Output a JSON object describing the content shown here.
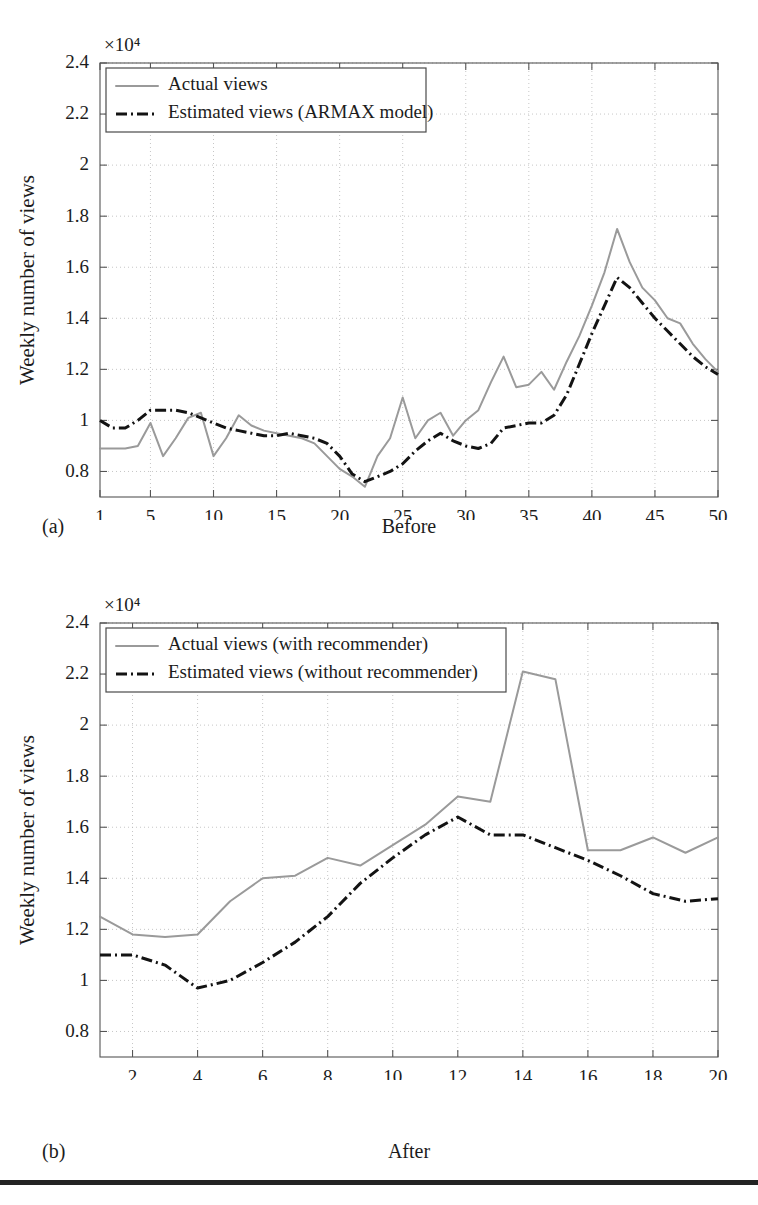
{
  "figure": {
    "panel_a": {
      "tag": "(a)",
      "caption": "Before"
    },
    "panel_b": {
      "tag": "(b)",
      "caption": "After"
    },
    "bottom_rule_color": "#232323"
  },
  "colors": {
    "actual_series": "#9a9a9a",
    "estimated_series": "#131313",
    "axis": "#555555",
    "grid": "#b8b8b8",
    "text": "#1c1c1c"
  },
  "chart_data": [
    {
      "id": "chart-before",
      "type": "line",
      "title": "",
      "xlabel": "Week",
      "ylabel": "Weekly number of views",
      "exponent_label": "×10⁴",
      "y_scale_factor": 10000,
      "xlim": [
        1,
        50
      ],
      "ylim": [
        0.7,
        2.4
      ],
      "yticks": [
        0.8,
        1,
        1.2,
        1.4,
        1.6,
        1.8,
        2,
        2.2,
        2.4
      ],
      "ytick_labels": [
        "0.8",
        "1",
        "1.2",
        "1.4",
        "1.6",
        "1.8",
        "2",
        "2.2",
        "2.4"
      ],
      "xticks": [
        1,
        5,
        10,
        15,
        20,
        25,
        30,
        35,
        40,
        45,
        50
      ],
      "xtick_labels": [
        "1",
        "5",
        "10",
        "15",
        "20",
        "25",
        "30",
        "35",
        "40",
        "45",
        "50"
      ],
      "grid": true,
      "legend_position": "top-left",
      "x": [
        1,
        2,
        3,
        4,
        5,
        6,
        7,
        8,
        9,
        10,
        11,
        12,
        13,
        14,
        15,
        16,
        17,
        18,
        19,
        20,
        21,
        22,
        23,
        24,
        25,
        26,
        27,
        28,
        29,
        30,
        31,
        32,
        33,
        34,
        35,
        36,
        37,
        38,
        39,
        40,
        41,
        42,
        43,
        44,
        45,
        46,
        47,
        48,
        49,
        50
      ],
      "series": [
        {
          "name": "Actual views",
          "style": "solid",
          "color": "#9a9a9a",
          "values": [
            0.89,
            0.89,
            0.89,
            0.9,
            0.99,
            0.86,
            0.93,
            1.01,
            1.03,
            0.86,
            0.93,
            1.02,
            0.98,
            0.96,
            0.95,
            0.94,
            0.93,
            0.91,
            0.86,
            0.81,
            0.78,
            0.74,
            0.86,
            0.93,
            1.09,
            0.93,
            1.0,
            1.03,
            0.94,
            1.0,
            1.04,
            1.15,
            1.25,
            1.13,
            1.14,
            1.19,
            1.12,
            1.23,
            1.33,
            1.45,
            1.58,
            1.75,
            1.62,
            1.52,
            1.47,
            1.4,
            1.38,
            1.3,
            1.24,
            1.19
          ]
        },
        {
          "name": "Estimated views (ARMAX model)",
          "style": "dashdot",
          "color": "#131313",
          "values": [
            1.0,
            0.97,
            0.97,
            1.0,
            1.04,
            1.04,
            1.04,
            1.03,
            1.01,
            0.99,
            0.97,
            0.96,
            0.95,
            0.94,
            0.94,
            0.95,
            0.94,
            0.93,
            0.91,
            0.86,
            0.79,
            0.76,
            0.78,
            0.8,
            0.83,
            0.88,
            0.92,
            0.95,
            0.92,
            0.9,
            0.89,
            0.91,
            0.97,
            0.98,
            0.99,
            0.99,
            1.02,
            1.1,
            1.22,
            1.34,
            1.45,
            1.56,
            1.52,
            1.46,
            1.4,
            1.35,
            1.3,
            1.25,
            1.21,
            1.18
          ]
        }
      ]
    },
    {
      "id": "chart-after",
      "type": "line",
      "title": "",
      "xlabel": "Week",
      "ylabel": "Weekly number of views",
      "exponent_label": "×10⁴",
      "y_scale_factor": 10000,
      "xlim": [
        1,
        20
      ],
      "ylim": [
        0.7,
        2.4
      ],
      "yticks": [
        0.8,
        1,
        1.2,
        1.4,
        1.6,
        1.8,
        2,
        2.2,
        2.4
      ],
      "ytick_labels": [
        "0.8",
        "1",
        "1.2",
        "1.4",
        "1.6",
        "1.8",
        "2",
        "2.2",
        "2.4"
      ],
      "xticks": [
        2,
        4,
        6,
        8,
        10,
        12,
        14,
        16,
        18,
        20
      ],
      "xtick_labels": [
        "2",
        "4",
        "6",
        "8",
        "10",
        "12",
        "14",
        "16",
        "18",
        "20"
      ],
      "grid": true,
      "legend_position": "top-left",
      "x": [
        1,
        2,
        3,
        4,
        5,
        6,
        7,
        8,
        9,
        10,
        11,
        12,
        13,
        14,
        15,
        16,
        17,
        18,
        19,
        20
      ],
      "series": [
        {
          "name": "Actual views (with recommender)",
          "style": "solid",
          "color": "#9a9a9a",
          "values": [
            1.25,
            1.18,
            1.17,
            1.18,
            1.31,
            1.4,
            1.41,
            1.48,
            1.45,
            1.53,
            1.61,
            1.72,
            1.7,
            2.21,
            2.18,
            1.51,
            1.51,
            1.56,
            1.5,
            1.56,
            1.44
          ]
        },
        {
          "name": "Estimated views (without recommender)",
          "style": "dashdot",
          "color": "#131313",
          "values": [
            1.1,
            1.1,
            1.06,
            0.97,
            1.0,
            1.07,
            1.15,
            1.25,
            1.38,
            1.48,
            1.57,
            1.64,
            1.57,
            1.57,
            1.52,
            1.47,
            1.41,
            1.34,
            1.31,
            1.32,
            1.4,
            1.31,
            1.27,
            1.27
          ]
        }
      ]
    }
  ]
}
